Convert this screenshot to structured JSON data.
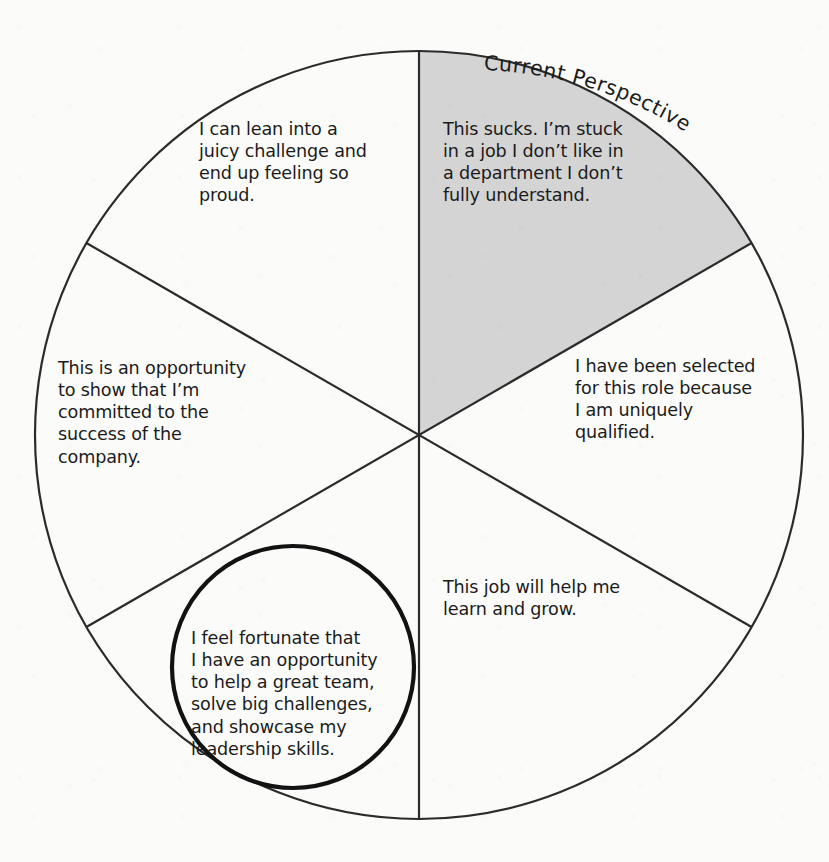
{
  "diagram": {
    "title": "Current Perspective",
    "type": "pie-wedge-reframe-diagram",
    "colors": {
      "page_background": "#fbfbf9",
      "outline": "#2b2b2b",
      "shaded_sector_fill": "#d4d4d4",
      "text": "#1b1b1b",
      "highlight_circle": "#121212"
    },
    "geometry": {
      "center_x": 419,
      "center_y": 435,
      "radius": 384,
      "sector_count": 6,
      "spoke_angles_deg": [
        90,
        30,
        -30,
        -90,
        -150,
        150
      ]
    },
    "callout_label": {
      "text": "Current Perspective",
      "target_sector": 1,
      "position": "along-outer-arc-upper-right"
    },
    "sectors": [
      {
        "id": 1,
        "position": "top-right",
        "shaded": true,
        "highlighted": false,
        "text": "This sucks. I’m stuck\nin a job I don’t like in\na department I don’t\nfully understand."
      },
      {
        "id": 2,
        "position": "right",
        "shaded": false,
        "highlighted": false,
        "text": "I have been selected\nfor this role because\nI am uniquely\nqualified."
      },
      {
        "id": 3,
        "position": "bottom-right",
        "shaded": false,
        "highlighted": false,
        "text": "This job will help me\nlearn and grow."
      },
      {
        "id": 4,
        "position": "bottom-left",
        "shaded": false,
        "highlighted": true,
        "text": "I feel fortunate that\nI have an opportunity\nto help a great team,\nsolve big challenges,\nand showcase my\nleadership skills."
      },
      {
        "id": 5,
        "position": "left",
        "shaded": false,
        "highlighted": false,
        "text": "This is an opportunity\nto show that I’m\ncommitted to the\nsuccess of the\ncompany."
      },
      {
        "id": 6,
        "position": "top-left",
        "shaded": false,
        "highlighted": false,
        "text": "I can lean into a\njuicy challenge and\nend up feeling so\nproud."
      }
    ]
  }
}
